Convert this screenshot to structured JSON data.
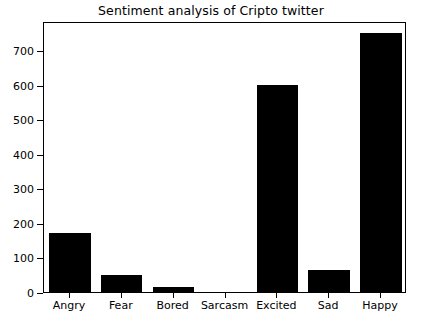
{
  "chart_data": {
    "type": "bar",
    "title": "Sentiment analysis of Cripto twitter",
    "categories": [
      "Angry",
      "Fear",
      "Bored",
      "Sarcasm",
      "Excited",
      "Sad",
      "Happy"
    ],
    "values": [
      170,
      50,
      15,
      0,
      600,
      65,
      750
    ],
    "xlabel": "",
    "ylabel": "",
    "ylim": [
      0,
      785
    ],
    "yticks": [
      0,
      100,
      200,
      300,
      400,
      500,
      600,
      700
    ],
    "ytick_labels": [
      "0",
      "100",
      "200",
      "300",
      "400",
      "500",
      "600",
      "700"
    ],
    "grid": false,
    "legend": false,
    "bar_color": "#000000",
    "background_color": "#ffffff",
    "axes_color": "#000000"
  }
}
